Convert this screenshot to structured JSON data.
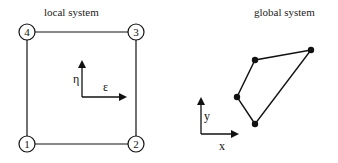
{
  "local": {
    "title": "local system",
    "nodes": [
      {
        "id": "1",
        "cx": 27,
        "cy": 144
      },
      {
        "id": "2",
        "cx": 136,
        "cy": 144
      },
      {
        "id": "3",
        "cx": 136,
        "cy": 32
      },
      {
        "id": "4",
        "cx": 27,
        "cy": 32
      }
    ],
    "axes": {
      "vertical_label": "η",
      "horizontal_label": "ε"
    }
  },
  "global": {
    "title": "global system",
    "vertices": [
      {
        "x": 255,
        "y": 124
      },
      {
        "x": 237,
        "y": 97
      },
      {
        "x": 255,
        "y": 60
      },
      {
        "x": 311,
        "y": 50
      }
    ],
    "axes": {
      "vertical_label": "y",
      "horizontal_label": "x"
    }
  },
  "colors": {
    "line": "#111111",
    "background": "#ffffff"
  }
}
